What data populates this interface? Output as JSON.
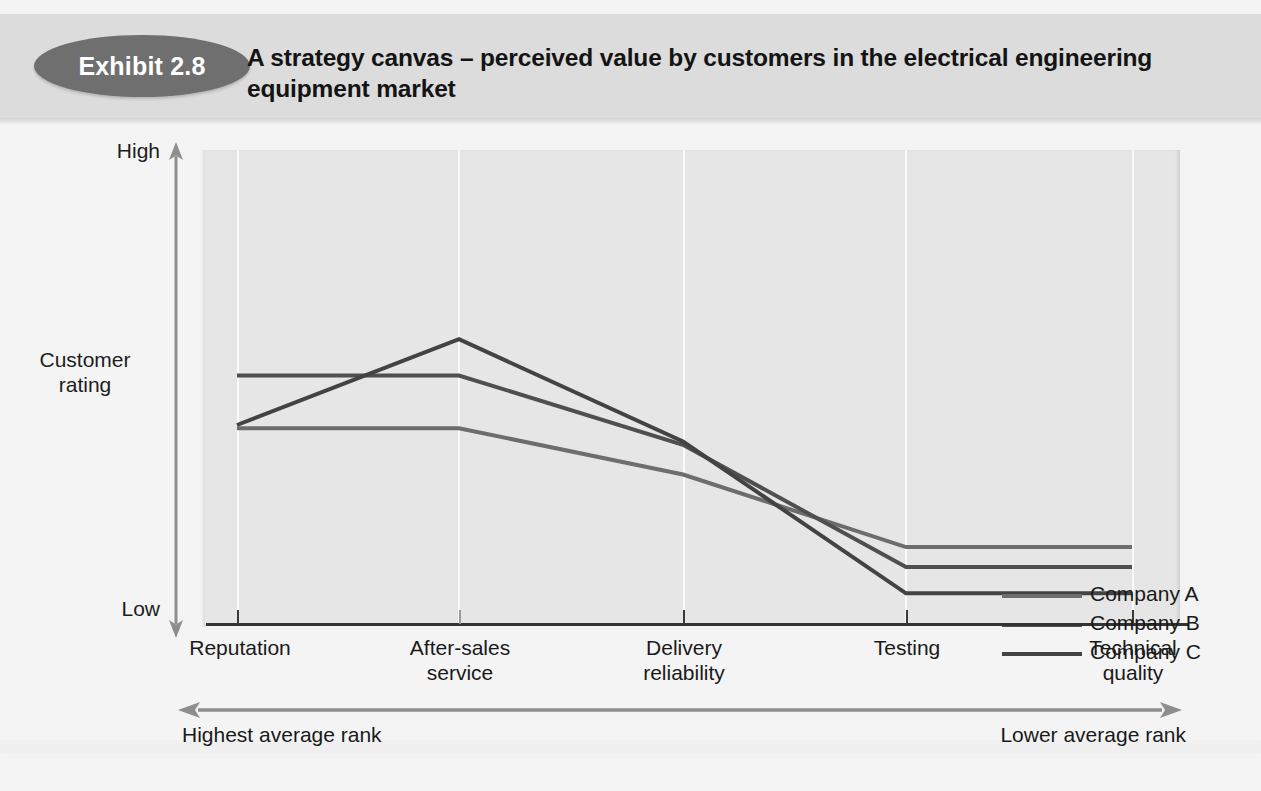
{
  "exhibit": {
    "badge_label": "Exhibit 2.8",
    "title": "A strategy canvas – perceived value by customers in the electrical engineering equipment market",
    "badge_color": "#6f6f6f",
    "header_band_color": "#dcdcdc"
  },
  "axes": {
    "y_title": "Customer\nrating",
    "y_high_label": "High",
    "y_low_label": "Low",
    "rank_left_label": "Highest average rank",
    "rank_right_label": "Lower average rank"
  },
  "legend": {
    "position": "right",
    "entries": [
      {
        "label": "Company A",
        "color": "#6d6d6d"
      },
      {
        "label": "Company B",
        "color": "#4f4f4f"
      },
      {
        "label": "Company C",
        "color": "#434343"
      }
    ]
  },
  "chart_data": {
    "type": "line",
    "title": "A strategy canvas – perceived value by customers in the electrical engineering equipment market",
    "xlabel": "",
    "ylabel": "Customer rating",
    "ylim": [
      0,
      100
    ],
    "ytick_labels": [
      "Low",
      "High"
    ],
    "grid": true,
    "categories": [
      "Reputation",
      "After-sales service",
      "Delivery reliability",
      "Testing",
      "Technical quality"
    ],
    "series": [
      {
        "name": "Company A",
        "color": "#6d6d6d",
        "values": [
          59,
          59,
          45,
          23,
          23
        ]
      },
      {
        "name": "Company B",
        "color": "#4f4f4f",
        "values": [
          75,
          75,
          54,
          17,
          17
        ]
      },
      {
        "name": "Company C",
        "color": "#434343",
        "values": [
          60,
          86,
          55,
          9,
          9
        ]
      }
    ],
    "annotations": [
      "Highest average rank",
      "Lower average rank"
    ]
  }
}
